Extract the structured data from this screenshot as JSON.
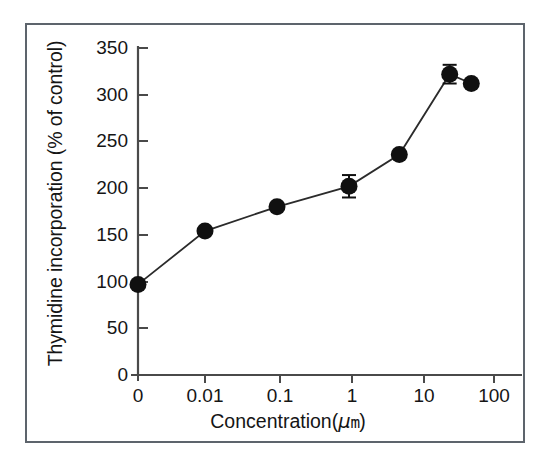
{
  "chart_data": {
    "type": "line",
    "title": "",
    "xlabel": "Concentration(μm)",
    "ylabel": "Thymidine incorporation (% of control)",
    "xlabel_parts": {
      "prefix": "Concentration(",
      "mu": "μ",
      "unit": "m",
      "suffix": ")"
    },
    "x_tick_labels": [
      "0",
      "0.01",
      "0.1",
      "1",
      "10",
      "100"
    ],
    "x_tick_values": [
      0,
      0.01,
      0.1,
      1,
      10,
      100
    ],
    "y_tick_labels": [
      "0",
      "50",
      "100",
      "150",
      "200",
      "250",
      "300",
      "350"
    ],
    "y_tick_values": [
      0,
      50,
      100,
      150,
      200,
      250,
      300,
      350
    ],
    "ylim": [
      0,
      350
    ],
    "xscale": "log-with-zero-break",
    "grid": false,
    "legend": false,
    "marker": "filled-circle",
    "marker_color": "#101010",
    "line_color": "#2b2b2b",
    "points": [
      {
        "x_label": "0",
        "x_value": 0,
        "y": 97,
        "error": 0
      },
      {
        "x_label": "0.01",
        "x_value": 0.01,
        "y": 154,
        "error": 0
      },
      {
        "x_label": "0.1",
        "x_value": 0.1,
        "y": 180,
        "error": 0
      },
      {
        "x_label": "1",
        "x_value": 1,
        "y": 202,
        "error": 12
      },
      {
        "x_label": "5",
        "x_value": 5,
        "y": 236,
        "error": 0
      },
      {
        "x_label": "25",
        "x_value": 25,
        "y": 322,
        "error": 10
      },
      {
        "x_label": "50",
        "x_value": 50,
        "y": 312,
        "error": 0
      }
    ],
    "series": [
      {
        "name": "Thymidine incorporation",
        "values": [
          97,
          154,
          180,
          202,
          236,
          322,
          312
        ],
        "errors": [
          0,
          0,
          0,
          12,
          0,
          10,
          0
        ]
      }
    ]
  },
  "figure": {
    "border_color": "#5d646c",
    "background": "#ffffff",
    "axis_color": "#404040"
  }
}
